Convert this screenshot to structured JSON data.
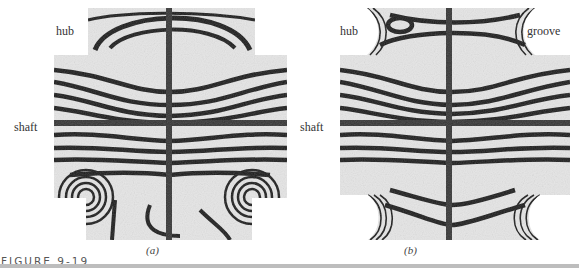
{
  "figure": {
    "caption": "FIGURE 9-19",
    "panels": [
      {
        "id": "a",
        "sublabel": "(a)",
        "labels": {
          "hub": "hub",
          "shaft": "shaft"
        },
        "description": "Photoelastic fringe pattern of shaft with hub, no groove"
      },
      {
        "id": "b",
        "sublabel": "(b)",
        "labels": {
          "hub": "hub",
          "groove": "groove",
          "shaft": "shaft"
        },
        "description": "Photoelastic fringe pattern of shaft with hub and stress-relief grooves"
      }
    ]
  },
  "colors": {
    "fringe_dark": "#1a1a1a",
    "fringe_light": "#e8e8e8",
    "rule": "#bdbdbd",
    "caption": "#555555"
  }
}
